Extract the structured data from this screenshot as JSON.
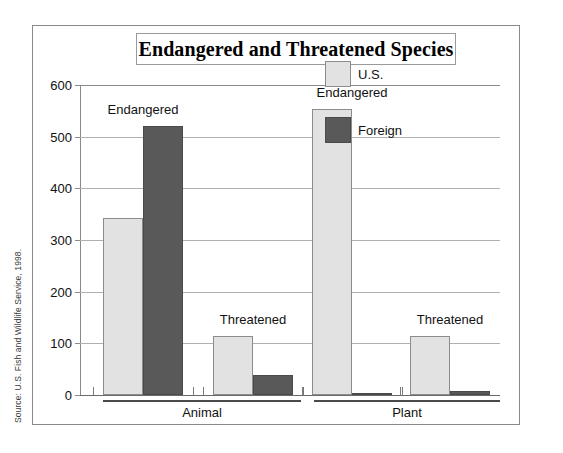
{
  "figure": {
    "title": "Endangered and Threatened Species",
    "source_note": "Source: U.S. Fish and Wildlife Service, 1998."
  },
  "legend": {
    "position": "inside-top-right",
    "entries": [
      {
        "label": "U.S.",
        "color": "#e2e2e2"
      },
      {
        "label": "Foreign",
        "color": "#595959"
      }
    ]
  },
  "axis": {
    "y_ticks": [
      "0",
      "100",
      "200",
      "300",
      "400",
      "500",
      "600"
    ],
    "y_min": 0,
    "y_max": 600
  },
  "groups": [
    {
      "label": "Animal"
    },
    {
      "label": "Plant"
    }
  ],
  "status_labels": [
    {
      "text": "Endangered"
    },
    {
      "text": "Threatened"
    },
    {
      "text": "Endangered"
    },
    {
      "text": "Threatened"
    }
  ],
  "chart_data": {
    "type": "bar",
    "title": "Endangered and Threatened Species",
    "xlabel": "",
    "ylabel": "",
    "ylim": [
      0,
      600
    ],
    "ytick_step": 100,
    "grid": true,
    "legend_position": "inside-top-right",
    "source": "Source: U.S. Fish and Wildlife Service, 1998.",
    "categories": [
      "Animal - Endangered",
      "Animal - Threatened",
      "Plant - Endangered",
      "Plant - Threatened"
    ],
    "groups": [
      "Animal",
      "Animal",
      "Plant",
      "Plant"
    ],
    "status": [
      "Endangered",
      "Threatened",
      "Endangered",
      "Threatened"
    ],
    "series": [
      {
        "name": "U.S.",
        "color": "#e2e2e2",
        "values": [
          342,
          115,
          553,
          115
        ]
      },
      {
        "name": "Foreign",
        "color": "#595959",
        "values": [
          520,
          38,
          3,
          8
        ]
      }
    ]
  }
}
